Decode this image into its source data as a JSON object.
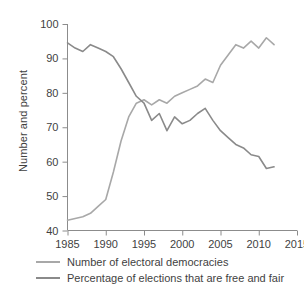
{
  "chart_data": {
    "type": "line",
    "title": "",
    "xlabel": "",
    "ylabel": "Number and percent",
    "xlim": [
      1985,
      2015
    ],
    "ylim": [
      40,
      100
    ],
    "grid": false,
    "legend_position": "bottom-left",
    "xticks": [
      "1985",
      "1990",
      "1995",
      "2000",
      "2005",
      "2010",
      "2015"
    ],
    "yticks": [
      "40",
      "50",
      "60",
      "70",
      "80",
      "90",
      "100"
    ],
    "x": [
      1985,
      1986,
      1987,
      1988,
      1989,
      1990,
      1991,
      1992,
      1993,
      1994,
      1995,
      1996,
      1997,
      1998,
      1999,
      2000,
      2001,
      2002,
      2003,
      2004,
      2005,
      2006,
      2007,
      2008,
      2009,
      2010,
      2011,
      2012
    ],
    "series": [
      {
        "name": "Number of electoral democracies",
        "color": "#a8a8a8",
        "values": [
          43,
          43.5,
          44,
          45,
          47,
          49,
          57,
          66,
          73,
          77,
          78,
          76.5,
          78,
          77,
          79,
          80,
          81,
          82,
          84,
          83,
          88,
          91,
          94,
          93,
          95,
          93,
          96,
          94
        ]
      },
      {
        "name": "Percentage of elections that are free and fair",
        "color": "#8a8a8a",
        "values": [
          94.5,
          93,
          92,
          94,
          93,
          92,
          90.5,
          87,
          83,
          79,
          77,
          72,
          74,
          69,
          73,
          71,
          72,
          74,
          75.5,
          72,
          69,
          67,
          65,
          64,
          62,
          61.5,
          58,
          58.5
        ]
      }
    ]
  },
  "legend": {
    "items": [
      {
        "label": "Number of electoral democracies",
        "color": "#a8a8a8"
      },
      {
        "label": "Percentage of elections that are free and fair",
        "color": "#8a8a8a"
      }
    ]
  },
  "axes": {
    "y_title": "Number and percent"
  }
}
